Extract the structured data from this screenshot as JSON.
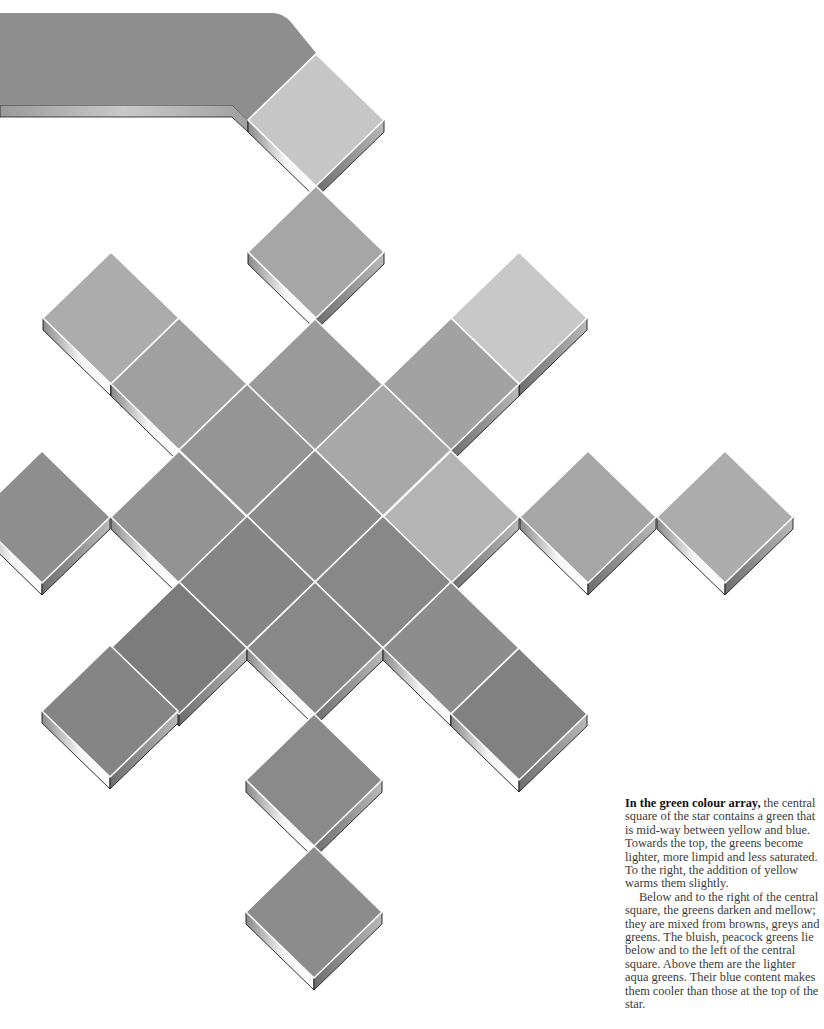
{
  "caption": {
    "lead": "In the green colour array,",
    "paragraph1_rest": " the central square of the star contains a green that is mid-way between yellow and blue. Towards the top, the greens become lighter, more limpid and less saturated. To the right, the addition of yellow warms them slightly.",
    "paragraph2": "Below and to the right of the central square, the greens darken and mellow; they are mixed from browns, greys and greens. The bluish, peacock greens lie below and to the left of the central square. Above them are the lighter aqua greens. Their blue content makes them cooler than those at the top of the star."
  },
  "art": {
    "tile_half_width": 68,
    "tile_half_height": 66,
    "thickness": 12,
    "grout_color": "#ffffff",
    "edge_color": "#1a1a1a",
    "top_bar": {
      "color": "#8e8e8e",
      "label": "swatch-bar"
    },
    "tiles": [
      {
        "cx": 316,
        "cy": 120,
        "color": "#c6c6c6",
        "name": "tile-top"
      },
      {
        "cx": 316,
        "cy": 252,
        "color": "#a6a6a6",
        "name": "tile-upper"
      },
      {
        "cx": 315,
        "cy": 385,
        "color": "#9a9a9a",
        "name": "tile-above-center-2"
      },
      {
        "cx": 111,
        "cy": 318,
        "color": "#acacac",
        "name": "tile-nw-3"
      },
      {
        "cx": 179,
        "cy": 384,
        "color": "#a0a0a0",
        "name": "tile-nw-2"
      },
      {
        "cx": 247,
        "cy": 450,
        "color": "#959595",
        "name": "tile-nw-1"
      },
      {
        "cx": 519,
        "cy": 318,
        "color": "#c8c8c8",
        "name": "tile-ne-3"
      },
      {
        "cx": 451,
        "cy": 384,
        "color": "#a2a2a2",
        "name": "tile-ne-2"
      },
      {
        "cx": 383,
        "cy": 450,
        "color": "#a8a8a8",
        "name": "tile-ne-1"
      },
      {
        "cx": 42,
        "cy": 517,
        "color": "#8e8e8e",
        "name": "tile-w-3"
      },
      {
        "cx": 179,
        "cy": 517,
        "color": "#939393",
        "name": "tile-w-1"
      },
      {
        "cx": 315,
        "cy": 516,
        "color": "#8d8d8d",
        "name": "tile-center"
      },
      {
        "cx": 451,
        "cy": 517,
        "color": "#b4b4b4",
        "name": "tile-e-1"
      },
      {
        "cx": 588,
        "cy": 517,
        "color": "#a6a6a6",
        "name": "tile-e-2"
      },
      {
        "cx": 725,
        "cy": 517,
        "color": "#acacac",
        "name": "tile-e-3"
      },
      {
        "cx": 247,
        "cy": 582,
        "color": "#858585",
        "name": "tile-sw-1"
      },
      {
        "cx": 383,
        "cy": 582,
        "color": "#888888",
        "name": "tile-se-1"
      },
      {
        "cx": 179,
        "cy": 648,
        "color": "#7c7c7c",
        "name": "tile-sw-2"
      },
      {
        "cx": 315,
        "cy": 648,
        "color": "#888888",
        "name": "tile-below-center"
      },
      {
        "cx": 451,
        "cy": 648,
        "color": "#8d8d8d",
        "name": "tile-se-2"
      },
      {
        "cx": 110,
        "cy": 711,
        "color": "#858585",
        "name": "tile-sw-3"
      },
      {
        "cx": 519,
        "cy": 714,
        "color": "#818181",
        "name": "tile-se-3"
      },
      {
        "cx": 314,
        "cy": 780,
        "color": "#8a8a8a",
        "name": "tile-bottom-1"
      },
      {
        "cx": 314,
        "cy": 912,
        "color": "#8c8c8c",
        "name": "tile-bottom-2"
      }
    ]
  }
}
